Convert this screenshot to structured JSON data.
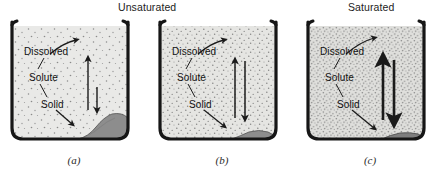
{
  "figure": {
    "width": 444,
    "height": 170,
    "background": "#ffffff",
    "ink": "#1a1a1a"
  },
  "groups": [
    {
      "id": "unsaturated",
      "label": "Unsaturated",
      "spans_panels": [
        "a",
        "b"
      ]
    },
    {
      "id": "saturated",
      "label": "Saturated",
      "spans_panels": [
        "c"
      ]
    }
  ],
  "labels": {
    "dissolved": "Dissolved",
    "solute": "Solute",
    "solid": "Solid"
  },
  "panels": [
    {
      "id": "a",
      "caption": "(a)",
      "group": "Unsaturated",
      "solution_fill": "#e9e9e7",
      "speckle_density": "low",
      "sediment": "large-mound-right",
      "sediment_fill": "#8c8c8c",
      "up_arrow": "long",
      "down_arrow": "short",
      "arrow_style": "thin",
      "meaning": "dissolving faster than crystallizing"
    },
    {
      "id": "b",
      "caption": "(b)",
      "group": "Unsaturated",
      "solution_fill": "#e4e4e1",
      "speckle_density": "medium",
      "sediment": "small-flat-mound-right",
      "sediment_fill": "#8c8c8c",
      "up_arrow": "long",
      "down_arrow": "long",
      "arrow_style": "thin",
      "meaning": "approaching equilibrium"
    },
    {
      "id": "c",
      "caption": "(c)",
      "group": "Saturated",
      "solution_fill": "#dededb",
      "speckle_density": "high",
      "sediment": "thin-flat-mound-right",
      "sediment_fill": "#7a7a7a",
      "up_arrow": "long",
      "down_arrow": "long",
      "arrow_style": "bold",
      "meaning": "dynamic equilibrium, saturated"
    }
  ]
}
